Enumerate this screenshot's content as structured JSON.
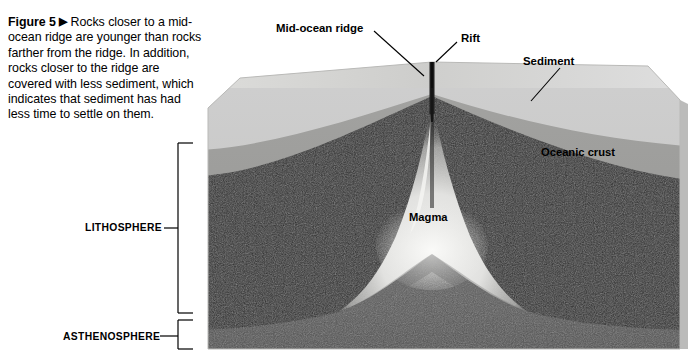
{
  "figure": {
    "number_label": "Figure 5",
    "arrow_glyph": "▶",
    "caption": "Rocks closer to a mid-ocean ridge are younger than rocks farther from the ridge. In addition, rocks closer to the ridge are covered with less sediment, which indicates that sediment has had less time to settle on them."
  },
  "labels": {
    "mid_ocean_ridge": "Mid-ocean ridge",
    "rift": "Rift",
    "sediment": "Sediment",
    "oceanic_crust": "Oceanic crust",
    "magma": "Magma",
    "lithosphere": "LITHOSPHERE",
    "asthenosphere": "ASTHENOSPHERE"
  },
  "colors": {
    "background": "#ffffff",
    "text": "#000000",
    "sediment_top": "#d5d5d3",
    "sediment_face": "#c9c9c7",
    "oceanic_crust": "#9c9c9a",
    "lithosphere": "#2d2d2d",
    "asthenosphere": "#575757",
    "magma": "#e8e8e6",
    "rift_line": "#1a1a1a",
    "leader_line": "#000000",
    "bracket": "#000000"
  },
  "diagram": {
    "type": "geologic-cross-section-block",
    "layers": [
      {
        "name": "Sediment",
        "order": 1,
        "shade": "light gray"
      },
      {
        "name": "Oceanic crust",
        "order": 2,
        "shade": "medium gray"
      },
      {
        "name": "Lithosphere (mantle)",
        "order": 3,
        "shade": "near black"
      },
      {
        "name": "Asthenosphere",
        "order": 4,
        "shade": "dark gray"
      },
      {
        "name": "Magma",
        "order": 5,
        "shade": "pale / bright"
      }
    ],
    "brackets": [
      {
        "label": "LITHOSPHERE",
        "spans": "crust through dark mantle layer"
      },
      {
        "label": "ASTHENOSPHERE",
        "spans": "lowest layer"
      }
    ],
    "callouts": [
      {
        "label": "Mid-ocean ridge",
        "points_to": "ridge crest top face"
      },
      {
        "label": "Rift",
        "points_to": "central rift valley slot"
      },
      {
        "label": "Sediment",
        "points_to": "upper light gray layer"
      }
    ]
  }
}
